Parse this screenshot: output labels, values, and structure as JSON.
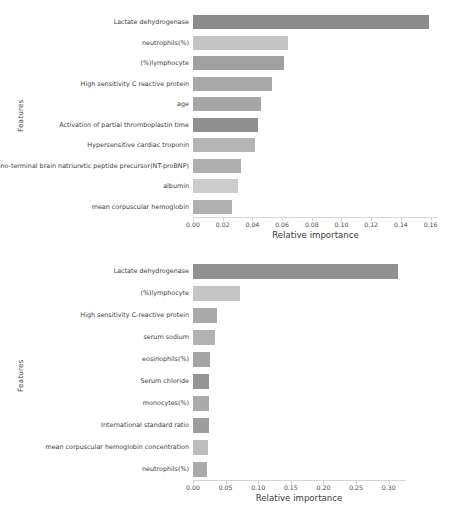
{
  "chart_data": [
    {
      "type": "bar",
      "orientation": "horizontal",
      "title": "",
      "xlabel": "Relative importance",
      "ylabel": "Features",
      "xlim": [
        0.0,
        0.165
      ],
      "xticks": [
        "0.00",
        "0.02",
        "0.04",
        "0.06",
        "0.08",
        "0.10",
        "0.12",
        "0.14",
        "0.16"
      ],
      "xtick_values": [
        0.0,
        0.02,
        0.04,
        0.06,
        0.08,
        0.1,
        0.12,
        0.14,
        0.16
      ],
      "grid": false,
      "legend": "none",
      "categories": [
        "Lactate dehydrogenase",
        "neutrophils(%)",
        "(%)lymphocyte",
        "High sensitivity C reactive protein",
        "age",
        "Activation of partial thromboplastin time",
        "Hypersensitive cardiac troponin",
        "Amino-terminal brain natriuretic peptide precursor(NT-proBNP)",
        "albumin",
        "mean corpuscular hemoglobin"
      ],
      "values": [
        0.159,
        0.064,
        0.061,
        0.053,
        0.046,
        0.044,
        0.042,
        0.032,
        0.03,
        0.026
      ],
      "bar_colors": [
        "#8c8c8c",
        "#c4c4c4",
        "#a0a0a0",
        "#a8a8a8",
        "#a5a5a5",
        "#8f8f8f",
        "#b5b5b5",
        "#aeaeae",
        "#cccccc",
        "#b0b0b0"
      ]
    },
    {
      "type": "bar",
      "orientation": "horizontal",
      "title": "",
      "xlabel": "Relative importance",
      "ylabel": "Features",
      "xlim": [
        0.0,
        0.325
      ],
      "xticks": [
        "0.00",
        "0.05",
        "0.10",
        "0.15",
        "0.20",
        "0.25",
        "0.30"
      ],
      "xtick_values": [
        0.0,
        0.05,
        0.1,
        0.15,
        0.2,
        0.25,
        0.3
      ],
      "grid": false,
      "legend": "none",
      "categories": [
        "Lactate dehydrogenase",
        "(%)lymphocyte",
        "High sensitivity C-reactive protein",
        "serum sodium",
        "eosinophils(%)",
        "Serum chloride",
        "monocytes(%)",
        "International standard ratio",
        "mean corpuscular hemoglobin concentration",
        "neutrophils(%)"
      ],
      "values": [
        0.315,
        0.072,
        0.037,
        0.033,
        0.026,
        0.025,
        0.024,
        0.024,
        0.023,
        0.022
      ],
      "bar_colors": [
        "#919191",
        "#c6c6c6",
        "#a9a9a9",
        "#b2b2b2",
        "#a3a3a3",
        "#949494",
        "#ababab",
        "#9d9d9d",
        "#bdbdbd",
        "#aaaaaa"
      ]
    }
  ]
}
